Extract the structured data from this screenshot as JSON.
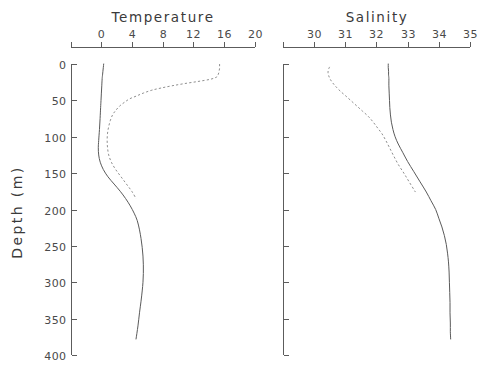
{
  "figure": {
    "width": 487,
    "height": 380,
    "background": "#ffffff",
    "depth_axis_title": "Depth (m)"
  },
  "chart_data": [
    {
      "type": "line",
      "title": "Temperature",
      "xlabel": "Temperature",
      "ylabel": "Depth (m)",
      "xlim": [
        -2,
        20
      ],
      "ylim": [
        400,
        0
      ],
      "y_inverted": true,
      "grid": false,
      "legend": "none",
      "xticks": [
        0,
        4,
        8,
        12,
        16,
        20
      ],
      "xtick_labels": [
        "0",
        "4",
        "8",
        "12",
        "16",
        "20"
      ],
      "yticks": [
        0,
        50,
        100,
        150,
        200,
        250,
        300,
        350,
        400
      ],
      "ytick_labels": [
        "0",
        "50",
        "100",
        "150",
        "200",
        "250",
        "300",
        "350",
        "400"
      ],
      "series": [
        {
          "name": "winter-profile",
          "style": "solid",
          "color": "#5a5a5a",
          "x": [
            0.35,
            0.3,
            0.25,
            0.2,
            0.15,
            0.1,
            0.05,
            0.0,
            -0.05,
            -0.12,
            -0.2,
            -0.3,
            -0.35,
            -0.3,
            -0.1,
            0.3,
            0.9,
            1.7,
            2.5,
            3.2,
            3.8,
            4.3,
            4.7,
            5.0,
            5.2,
            5.35,
            5.45,
            5.5,
            5.5,
            5.45,
            5.35,
            5.2,
            5.0,
            4.8,
            4.55
          ],
          "depth": [
            0,
            5,
            10,
            15,
            20,
            30,
            40,
            50,
            60,
            75,
            90,
            105,
            115,
            125,
            135,
            145,
            155,
            165,
            175,
            185,
            195,
            205,
            215,
            228,
            240,
            252,
            264,
            276,
            288,
            300,
            312,
            326,
            342,
            360,
            378
          ]
        },
        {
          "name": "summer-profile",
          "style": "dashed",
          "color": "#8f8f8f",
          "x": [
            15.4,
            15.4,
            15.4,
            15.35,
            15.3,
            15.2,
            15.0,
            14.2,
            12.6,
            10.8,
            9.2,
            7.8,
            6.6,
            5.5,
            4.6,
            3.7,
            3.0,
            2.4,
            1.9,
            1.5,
            1.2,
            1.0,
            0.85,
            0.8,
            0.85,
            1.0,
            1.35,
            1.9,
            2.6,
            3.3,
            4.0,
            4.55
          ],
          "depth": [
            0,
            3,
            6,
            9,
            12,
            15,
            18,
            21,
            24,
            27,
            30,
            33,
            36,
            40,
            44,
            48,
            53,
            58,
            64,
            70,
            78,
            86,
            95,
            105,
            115,
            125,
            135,
            145,
            155,
            165,
            175,
            185
          ]
        }
      ]
    },
    {
      "type": "line",
      "title": "Salinity",
      "xlabel": "Salinity",
      "ylabel": "Depth (m)",
      "xlim": [
        29.45,
        35
      ],
      "ylim": [
        400,
        0
      ],
      "y_inverted": true,
      "grid": false,
      "legend": "none",
      "xticks": [
        30,
        31,
        32,
        33,
        34,
        35
      ],
      "xtick_labels": [
        "30",
        "31",
        "32",
        "33",
        "34",
        "35"
      ],
      "yticks": [
        0,
        50,
        100,
        150,
        200,
        250,
        300,
        350,
        400
      ],
      "ytick_labels": [
        "",
        "",
        "",
        "",
        "",
        "",
        "",
        "",
        ""
      ],
      "series": [
        {
          "name": "winter-profile",
          "style": "solid",
          "color": "#5a5a5a",
          "x": [
            32.38,
            32.38,
            32.39,
            32.39,
            32.4,
            32.4,
            32.41,
            32.42,
            32.43,
            32.45,
            32.48,
            32.53,
            32.6,
            32.7,
            32.85,
            33.0,
            33.2,
            33.4,
            33.6,
            33.75,
            33.9,
            34.0,
            34.1,
            34.18,
            34.24,
            34.28,
            34.31,
            34.33,
            34.34,
            34.35,
            34.36,
            34.36,
            34.37,
            34.37,
            34.38
          ],
          "depth": [
            0,
            5,
            10,
            15,
            20,
            30,
            40,
            50,
            60,
            70,
            80,
            90,
            100,
            110,
            122,
            134,
            148,
            162,
            176,
            188,
            200,
            212,
            224,
            236,
            248,
            260,
            272,
            286,
            300,
            314,
            328,
            342,
            356,
            368,
            378
          ]
        },
        {
          "name": "summer-profile",
          "style": "dashed",
          "color": "#8f8f8f",
          "x": [
            30.5,
            30.46,
            30.45,
            30.47,
            30.52,
            30.6,
            30.72,
            30.86,
            31.02,
            31.2,
            31.38,
            31.56,
            31.74,
            31.9,
            32.04,
            32.18,
            32.3,
            32.42,
            32.55,
            32.7,
            32.88,
            33.05,
            33.25
          ],
          "depth": [
            4,
            8,
            12,
            16,
            21,
            26,
            32,
            38,
            44,
            51,
            58,
            65,
            72,
            80,
            88,
            96,
            105,
            115,
            126,
            138,
            150,
            162,
            176
          ]
        }
      ]
    }
  ],
  "axes_geometry": {
    "temperature": {
      "x_left_px": 71,
      "x_right_px": 255,
      "x_zero_px": 101,
      "px_per_unit": 7.7
    },
    "salinity": {
      "x_left_px": 283,
      "x_right_px": 470,
      "x_30_px": 314,
      "px_per_unit": 31.2
    },
    "depth": {
      "y_top_px": 64,
      "y_bottom_px": 355,
      "px_per_meter": 0.7275
    }
  }
}
